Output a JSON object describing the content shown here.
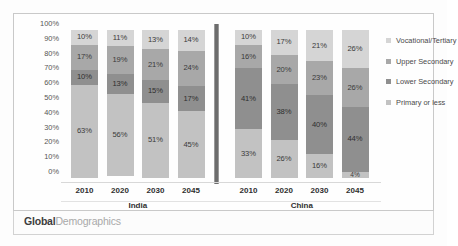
{
  "footer": {
    "logo_bold": "Global",
    "logo_light": "Demographics"
  },
  "legend": {
    "items": [
      {
        "label": "Vocational/Tertiary",
        "color": "#d5d5d5"
      },
      {
        "label": "Upper Secondary",
        "color": "#a8a8a8"
      },
      {
        "label": "Lower Secondary",
        "color": "#8f8f8f"
      },
      {
        "label": "Primary or less",
        "color": "#c2c2c2"
      }
    ]
  },
  "axis": {
    "yticks": [
      "100%",
      "90%",
      "80%",
      "70%",
      "60%",
      "50%",
      "40%",
      "30%",
      "20%",
      "10%",
      "0%"
    ]
  },
  "chart_data": {
    "type": "bar",
    "subtype": "100% stacked column",
    "title": "",
    "xlabel": "",
    "ylabel": "",
    "ylim": [
      0,
      100
    ],
    "grid": false,
    "legend_position": "right",
    "categories": [
      "2010",
      "2020",
      "2030",
      "2045",
      "2010",
      "2020",
      "2030",
      "2045"
    ],
    "groups": [
      {
        "name": "India",
        "categories": [
          "2010",
          "2020",
          "2030",
          "2045"
        ]
      },
      {
        "name": "China",
        "categories": [
          "2010",
          "2020",
          "2030",
          "2045"
        ]
      }
    ],
    "series": [
      {
        "name": "Vocational/Tertiary",
        "color": "#d5d5d5",
        "values": [
          10,
          11,
          13,
          14,
          10,
          17,
          21,
          26
        ]
      },
      {
        "name": "Upper Secondary",
        "color": "#a8a8a8",
        "values": [
          17,
          19,
          21,
          24,
          16,
          20,
          23,
          26
        ]
      },
      {
        "name": "Lower Secondary",
        "color": "#8f8f8f",
        "values": [
          10,
          13,
          15,
          17,
          41,
          38,
          40,
          44
        ]
      },
      {
        "name": "Primary or less",
        "color": "#c2c2c2",
        "values": [
          63,
          56,
          51,
          45,
          33,
          26,
          16,
          4
        ]
      }
    ],
    "bars": [
      {
        "group": "India",
        "category": "2010",
        "segments": [
          {
            "series": "Vocational/Tertiary",
            "value": 10,
            "label": "10%"
          },
          {
            "series": "Upper Secondary",
            "value": 17,
            "label": "17%"
          },
          {
            "series": "Lower Secondary",
            "value": 10,
            "label": "10%"
          },
          {
            "series": "Primary or less",
            "value": 63,
            "label": "63%"
          }
        ]
      },
      {
        "group": "India",
        "category": "2020",
        "segments": [
          {
            "series": "Vocational/Tertiary",
            "value": 11,
            "label": "11%"
          },
          {
            "series": "Upper Secondary",
            "value": 19,
            "label": "19%"
          },
          {
            "series": "Lower Secondary",
            "value": 13,
            "label": "13%"
          },
          {
            "series": "Primary or less",
            "value": 56,
            "label": "56%"
          }
        ]
      },
      {
        "group": "India",
        "category": "2030",
        "segments": [
          {
            "series": "Vocational/Tertiary",
            "value": 13,
            "label": "13%"
          },
          {
            "series": "Upper Secondary",
            "value": 21,
            "label": "21%"
          },
          {
            "series": "Lower Secondary",
            "value": 15,
            "label": "15%"
          },
          {
            "series": "Primary or less",
            "value": 51,
            "label": "51%"
          }
        ]
      },
      {
        "group": "India",
        "category": "2045",
        "segments": [
          {
            "series": "Vocational/Tertiary",
            "value": 14,
            "label": "14%"
          },
          {
            "series": "Upper Secondary",
            "value": 24,
            "label": "24%"
          },
          {
            "series": "Lower Secondary",
            "value": 17,
            "label": "17%"
          },
          {
            "series": "Primary or less",
            "value": 45,
            "label": "45%"
          }
        ]
      },
      {
        "group": "China",
        "category": "2010",
        "segments": [
          {
            "series": "Vocational/Tertiary",
            "value": 10,
            "label": "10%"
          },
          {
            "series": "Upper Secondary",
            "value": 16,
            "label": "16%"
          },
          {
            "series": "Lower Secondary",
            "value": 41,
            "label": "41%"
          },
          {
            "series": "Primary or less",
            "value": 33,
            "label": "33%"
          }
        ]
      },
      {
        "group": "China",
        "category": "2020",
        "segments": [
          {
            "series": "Vocational/Tertiary",
            "value": 17,
            "label": "17%"
          },
          {
            "series": "Upper Secondary",
            "value": 20,
            "label": "20%"
          },
          {
            "series": "Lower Secondary",
            "value": 38,
            "label": "38%"
          },
          {
            "series": "Primary or less",
            "value": 26,
            "label": "26%"
          }
        ]
      },
      {
        "group": "China",
        "category": "2030",
        "segments": [
          {
            "series": "Vocational/Tertiary",
            "value": 21,
            "label": "21%"
          },
          {
            "series": "Upper Secondary",
            "value": 23,
            "label": "23%"
          },
          {
            "series": "Lower Secondary",
            "value": 40,
            "label": "40%"
          },
          {
            "series": "Primary or less",
            "value": 16,
            "label": "16%"
          }
        ]
      },
      {
        "group": "China",
        "category": "2045",
        "segments": [
          {
            "series": "Vocational/Tertiary",
            "value": 26,
            "label": "26%"
          },
          {
            "series": "Upper Secondary",
            "value": 26,
            "label": "26%"
          },
          {
            "series": "Lower Secondary",
            "value": 44,
            "label": "44%"
          },
          {
            "series": "Primary or less",
            "value": 4,
            "label": "4%"
          }
        ]
      }
    ]
  }
}
